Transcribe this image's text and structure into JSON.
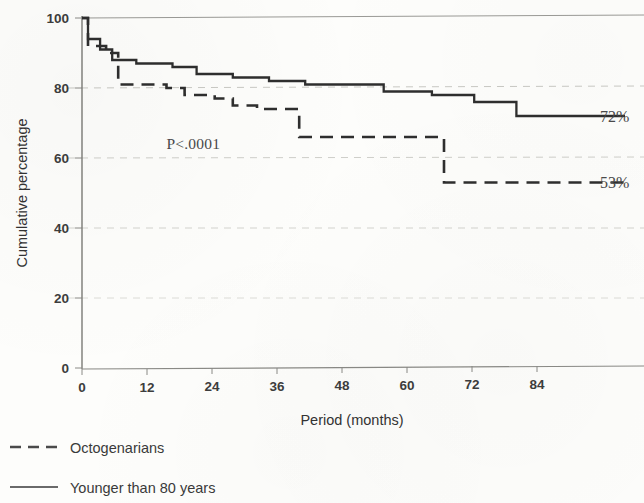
{
  "chart_data": {
    "type": "line",
    "title": "",
    "xlabel": "Period (months)",
    "ylabel": "Cumulative percentage",
    "xlim": [
      0,
      90
    ],
    "ylim": [
      0,
      100
    ],
    "xticks": [
      "0",
      "12",
      "24",
      "36",
      "48",
      "60",
      "72",
      "84"
    ],
    "xtick_values": [
      0,
      12,
      24,
      36,
      48,
      60,
      72,
      84
    ],
    "yticks": [
      "0",
      "20",
      "40",
      "60",
      "80",
      "100"
    ],
    "ytick_values": [
      0,
      20,
      40,
      60,
      80,
      100
    ],
    "grid": "horizontal-dashed",
    "legend_position": "below-axis-left",
    "annotations": [
      {
        "name": "p-value",
        "text": "P<.0001",
        "x": 14,
        "y": 64
      },
      {
        "name": "solid-endpoint-label",
        "text": "72%",
        "x": 90,
        "y": 72
      },
      {
        "name": "dashed-endpoint-label",
        "text": "53%",
        "x": 90,
        "y": 53
      }
    ],
    "series": [
      {
        "name": "Younger than 80 years",
        "style": "solid",
        "endpoint_label": "72%",
        "steps": [
          {
            "x": 0,
            "y": 100
          },
          {
            "x": 1,
            "y": 94
          },
          {
            "x": 3,
            "y": 91
          },
          {
            "x": 5,
            "y": 88
          },
          {
            "x": 9,
            "y": 87
          },
          {
            "x": 15,
            "y": 86
          },
          {
            "x": 19,
            "y": 84
          },
          {
            "x": 25,
            "y": 83
          },
          {
            "x": 31,
            "y": 82
          },
          {
            "x": 37,
            "y": 81
          },
          {
            "x": 50,
            "y": 79
          },
          {
            "x": 58,
            "y": 78
          },
          {
            "x": 65,
            "y": 76
          },
          {
            "x": 72,
            "y": 72
          },
          {
            "x": 90,
            "y": 72
          }
        ]
      },
      {
        "name": "Octogenarians",
        "style": "dashed",
        "endpoint_label": "53%",
        "steps": [
          {
            "x": 0,
            "y": 100
          },
          {
            "x": 1,
            "y": 92
          },
          {
            "x": 4,
            "y": 90
          },
          {
            "x": 6,
            "y": 81
          },
          {
            "x": 14,
            "y": 80
          },
          {
            "x": 17,
            "y": 78
          },
          {
            "x": 22,
            "y": 77
          },
          {
            "x": 25,
            "y": 75
          },
          {
            "x": 29,
            "y": 74
          },
          {
            "x": 36,
            "y": 66
          },
          {
            "x": 60,
            "y": 66
          },
          {
            "x": 60,
            "y": 53
          },
          {
            "x": 90,
            "y": 53
          }
        ]
      }
    ]
  },
  "legend": {
    "items": [
      {
        "label": "Octogenarians",
        "style": "dashed"
      },
      {
        "label": "Younger than 80 years",
        "style": "solid"
      }
    ]
  }
}
